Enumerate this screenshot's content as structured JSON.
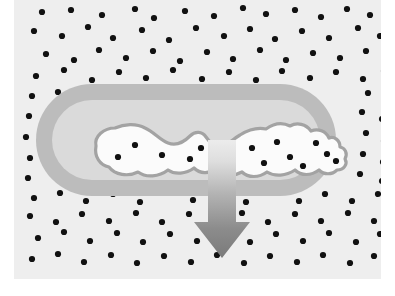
{
  "figure": {
    "type": "scientific-illustration",
    "canvas": {
      "width": 395,
      "height": 296,
      "background": "#ffffff"
    },
    "content_box": {
      "x": 14,
      "y": 0,
      "width": 367,
      "height": 279
    },
    "colors": {
      "page_background": "#ffffff",
      "matrix_background": "#eeeeee",
      "matrix_dot": "#111111",
      "capsule_outer_band": "#b9b9b9",
      "capsule_inner_band": "#d8d8d8",
      "blob_fill": "#fbfbfb",
      "blob_outline": "#a0a0a0",
      "arrow_light": "#e4e4e4",
      "arrow_dark": "#7b7b7b"
    },
    "elements": {
      "matrix_label": "dotted matrix region",
      "capsule_label": "capsule-shaped inclusion",
      "blob_label": "irregular white core",
      "arrow_label": "downward direction arrow"
    },
    "capsule": {
      "x": 36,
      "y": 84,
      "width": 300,
      "height": 112,
      "outer_radius": 56,
      "band_thickness": 16
    },
    "arrow": {
      "direction": "down",
      "shaft_x": 193,
      "shaft_width": 28,
      "top_y": 145,
      "tip_y": 258,
      "head_width": 56,
      "head_top_y": 222,
      "gradient_from": "#e9e9e9",
      "gradient_to": "#808080"
    },
    "blob_core_dots": [
      [
        121,
        145
      ],
      [
        104,
        157
      ],
      [
        148,
        155
      ],
      [
        176,
        159
      ],
      [
        187,
        148
      ],
      [
        208,
        151
      ],
      [
        238,
        148
      ],
      [
        250,
        163
      ],
      [
        263,
        142
      ],
      [
        276,
        157
      ],
      [
        289,
        166
      ],
      [
        302,
        143
      ],
      [
        313,
        154
      ],
      [
        322,
        161
      ]
    ],
    "matrix_dots": [
      [
        28,
        12
      ],
      [
        57,
        10
      ],
      [
        88,
        15
      ],
      [
        121,
        9
      ],
      [
        140,
        18
      ],
      [
        171,
        11
      ],
      [
        200,
        16
      ],
      [
        229,
        8
      ],
      [
        252,
        14
      ],
      [
        281,
        10
      ],
      [
        307,
        17
      ],
      [
        333,
        9
      ],
      [
        356,
        15
      ],
      [
        20,
        31
      ],
      [
        48,
        36
      ],
      [
        74,
        27
      ],
      [
        99,
        38
      ],
      [
        128,
        30
      ],
      [
        155,
        40
      ],
      [
        182,
        28
      ],
      [
        210,
        36
      ],
      [
        236,
        29
      ],
      [
        261,
        39
      ],
      [
        288,
        31
      ],
      [
        315,
        38
      ],
      [
        344,
        28
      ],
      [
        366,
        36
      ],
      [
        32,
        54
      ],
      [
        60,
        60
      ],
      [
        85,
        50
      ],
      [
        112,
        58
      ],
      [
        139,
        51
      ],
      [
        166,
        61
      ],
      [
        193,
        52
      ],
      [
        219,
        59
      ],
      [
        246,
        50
      ],
      [
        272,
        60
      ],
      [
        299,
        53
      ],
      [
        326,
        58
      ],
      [
        352,
        51
      ],
      [
        372,
        60
      ],
      [
        22,
        76
      ],
      [
        50,
        70
      ],
      [
        78,
        80
      ],
      [
        105,
        72
      ],
      [
        132,
        78
      ],
      [
        159,
        70
      ],
      [
        188,
        79
      ],
      [
        215,
        72
      ],
      [
        242,
        80
      ],
      [
        268,
        71
      ],
      [
        296,
        78
      ],
      [
        322,
        72
      ],
      [
        349,
        79
      ],
      [
        370,
        71
      ],
      [
        18,
        96
      ],
      [
        44,
        92
      ],
      [
        72,
        99
      ],
      [
        99,
        91
      ],
      [
        125,
        100
      ],
      [
        354,
        93
      ],
      [
        371,
        99
      ],
      [
        15,
        116
      ],
      [
        38,
        111
      ],
      [
        58,
        119
      ],
      [
        348,
        112
      ],
      [
        368,
        119
      ],
      [
        12,
        137
      ],
      [
        34,
        131
      ],
      [
        55,
        140
      ],
      [
        352,
        133
      ],
      [
        370,
        141
      ],
      [
        16,
        158
      ],
      [
        40,
        152
      ],
      [
        58,
        161
      ],
      [
        349,
        154
      ],
      [
        369,
        162
      ],
      [
        14,
        178
      ],
      [
        38,
        172
      ],
      [
        60,
        182
      ],
      [
        346,
        174
      ],
      [
        368,
        181
      ],
      [
        20,
        198
      ],
      [
        46,
        193
      ],
      [
        72,
        201
      ],
      [
        99,
        194
      ],
      [
        126,
        202
      ],
      [
        152,
        193
      ],
      [
        179,
        200
      ],
      [
        206,
        194
      ],
      [
        232,
        202
      ],
      [
        259,
        193
      ],
      [
        285,
        201
      ],
      [
        311,
        194
      ],
      [
        338,
        201
      ],
      [
        364,
        194
      ],
      [
        16,
        216
      ],
      [
        42,
        222
      ],
      [
        68,
        214
      ],
      [
        95,
        221
      ],
      [
        122,
        213
      ],
      [
        148,
        222
      ],
      [
        175,
        214
      ],
      [
        201,
        221
      ],
      [
        228,
        213
      ],
      [
        254,
        222
      ],
      [
        281,
        214
      ],
      [
        307,
        221
      ],
      [
        334,
        213
      ],
      [
        360,
        221
      ],
      [
        376,
        216
      ],
      [
        24,
        238
      ],
      [
        50,
        232
      ],
      [
        76,
        241
      ],
      [
        103,
        233
      ],
      [
        129,
        242
      ],
      [
        156,
        234
      ],
      [
        183,
        241
      ],
      [
        209,
        233
      ],
      [
        236,
        242
      ],
      [
        262,
        234
      ],
      [
        289,
        241
      ],
      [
        315,
        233
      ],
      [
        342,
        242
      ],
      [
        366,
        234
      ],
      [
        18,
        259
      ],
      [
        44,
        254
      ],
      [
        70,
        262
      ],
      [
        97,
        255
      ],
      [
        123,
        263
      ],
      [
        150,
        256
      ],
      [
        177,
        262
      ],
      [
        203,
        255
      ],
      [
        230,
        263
      ],
      [
        256,
        256
      ],
      [
        283,
        262
      ],
      [
        309,
        255
      ],
      [
        336,
        263
      ],
      [
        360,
        256
      ]
    ]
  }
}
